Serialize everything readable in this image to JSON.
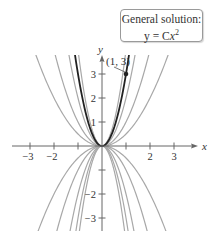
{
  "chart_data": {
    "type": "line",
    "annotation_box": {
      "line1": "General solution:",
      "line2_prefix": "y = C",
      "line2_var": "x",
      "line2_exp": "2"
    },
    "xlabel": "x",
    "ylabel": "y",
    "xlim": [
      -3.2,
      3.9
    ],
    "ylim": [
      -3.6,
      3.7
    ],
    "x_ticks": [
      -3,
      -2,
      -1,
      1,
      2,
      3
    ],
    "x_tick_labels": [
      "−3",
      "−2",
      "",
      "",
      "2",
      "3"
    ],
    "y_ticks": [
      -3,
      -2,
      -1,
      1,
      2,
      3
    ],
    "y_tick_labels": [
      "−3",
      "−2",
      "",
      "1",
      "2",
      "3"
    ],
    "grid": false,
    "series": [
      {
        "name": "C = 3 (particular solution)",
        "C": 3,
        "highlight": true
      },
      {
        "name": "C = 4",
        "C": 4,
        "highlight": false
      },
      {
        "name": "C = 2",
        "C": 2,
        "highlight": false
      },
      {
        "name": "C = 1",
        "C": 1,
        "highlight": false
      },
      {
        "name": "C = 0.5",
        "C": 0.5,
        "highlight": false
      },
      {
        "name": "C = -0.5",
        "C": -0.5,
        "highlight": false
      },
      {
        "name": "C = -1",
        "C": -1,
        "highlight": false
      },
      {
        "name": "C = -2",
        "C": -2,
        "highlight": false
      },
      {
        "name": "C = -3",
        "C": -3,
        "highlight": false
      },
      {
        "name": "C = -4",
        "C": -4,
        "highlight": false
      }
    ],
    "point": {
      "x": 1,
      "y": 3,
      "label": "(1, 3)"
    },
    "colors": {
      "highlight": "#222222",
      "family": "#a8a8a8",
      "axis": "#666666"
    }
  }
}
